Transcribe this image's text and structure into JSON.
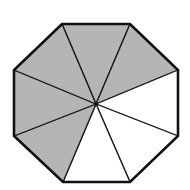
{
  "diagram": {
    "type": "shaded-octagon",
    "total_sectors": 8,
    "shaded_sectors": 5,
    "colors": {
      "shaded": "#b5b5b5",
      "unshaded": "#ffffff",
      "stroke": "#111111"
    },
    "center": [
      96,
      104
    ],
    "vertices": [
      [
        62,
        24
      ],
      [
        130,
        24
      ],
      [
        178,
        70
      ],
      [
        178,
        136
      ],
      [
        130,
        182
      ],
      [
        63,
        182
      ],
      [
        14,
        136
      ],
      [
        14,
        70
      ]
    ],
    "sectors": [
      {
        "from": 0,
        "to": 1,
        "shaded": true
      },
      {
        "from": 1,
        "to": 2,
        "shaded": true
      },
      {
        "from": 2,
        "to": 3,
        "shaded": false
      },
      {
        "from": 3,
        "to": 4,
        "shaded": false
      },
      {
        "from": 4,
        "to": 5,
        "shaded": false
      },
      {
        "from": 5,
        "to": 6,
        "shaded": true
      },
      {
        "from": 6,
        "to": 7,
        "shaded": true
      },
      {
        "from": 7,
        "to": 0,
        "shaded": true
      }
    ]
  }
}
